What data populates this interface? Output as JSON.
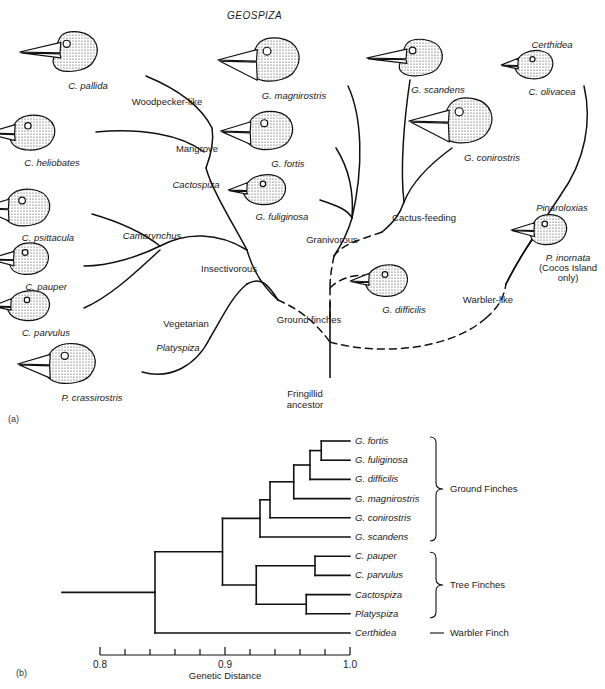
{
  "figure": {
    "panel_a_label": "(a)",
    "panel_b_label": "(b)",
    "genus_heading": "GEOSPIZA"
  },
  "panel_a": {
    "birds": [
      {
        "name": "C. pallida",
        "x": 60,
        "y": 28,
        "w": 84,
        "h": 48,
        "beak": "long",
        "label_x": 88,
        "label_y": 80
      },
      {
        "name": "C. heliobates",
        "x": 22,
        "y": 112,
        "w": 74,
        "h": 42,
        "beak": "medium",
        "label_x": 52,
        "label_y": 157
      },
      {
        "name": "C. psittacula",
        "x": 16,
        "y": 186,
        "w": 76,
        "h": 44,
        "beak": "thick",
        "label_x": 48,
        "label_y": 232
      },
      {
        "name": "C. pauper",
        "x": 20,
        "y": 240,
        "w": 64,
        "h": 38,
        "beak": "medium",
        "label_x": 46,
        "label_y": 281
      },
      {
        "name": "C. parvulus",
        "x": 22,
        "y": 288,
        "w": 62,
        "h": 36,
        "beak": "small",
        "label_x": 46,
        "label_y": 327
      },
      {
        "name": "P. crassirostris",
        "x": 58,
        "y": 340,
        "w": 84,
        "h": 48,
        "beak": "thick",
        "label_x": 92,
        "label_y": 392
      },
      {
        "name": "G. magnirostris",
        "x": 260,
        "y": 34,
        "w": 88,
        "h": 52,
        "beak": "huge",
        "label_x": 294,
        "label_y": 90
      },
      {
        "name": "G. fortis",
        "x": 258,
        "y": 108,
        "w": 78,
        "h": 46,
        "beak": "thick",
        "label_x": 288,
        "label_y": 158
      },
      {
        "name": "G. fuliginosa",
        "x": 258,
        "y": 172,
        "w": 62,
        "h": 36,
        "beak": "small",
        "label_x": 282,
        "label_y": 211
      },
      {
        "name": "G. scandens",
        "x": 406,
        "y": 36,
        "w": 82,
        "h": 44,
        "beak": "long",
        "label_x": 438,
        "label_y": 84
      },
      {
        "name": "G. conirostris",
        "x": 452,
        "y": 94,
        "w": 90,
        "h": 54,
        "beak": "huge",
        "label_x": 492,
        "label_y": 152
      },
      {
        "name": "C. olivacea",
        "x": 528,
        "y": 48,
        "w": 56,
        "h": 34,
        "beak": "small",
        "label_x": 552,
        "label_y": 86
      },
      {
        "name": "P. inornata",
        "x": 540,
        "y": 212,
        "w": 60,
        "h": 36,
        "beak": "medium",
        "label_x": 568,
        "label_y": 252
      },
      {
        "name": "G. difficilis",
        "x": 380,
        "y": 262,
        "w": 62,
        "h": 38,
        "beak": "small",
        "label_x": 404,
        "label_y": 304
      }
    ],
    "bird_extra_lines": [
      {
        "text": "(Cocos Island",
        "x": 568,
        "y": 262
      },
      {
        "text": "only)",
        "x": 568,
        "y": 272
      }
    ],
    "genus_labels": [
      {
        "text": "Cactospiza",
        "x": 196,
        "y": 179
      },
      {
        "text": "Camarynchus",
        "x": 152,
        "y": 230
      },
      {
        "text": "Platyspiza",
        "x": 178,
        "y": 342
      },
      {
        "text": "Certhidea",
        "x": 552,
        "y": 39
      },
      {
        "text": "Pinaroloxias",
        "x": 562,
        "y": 202
      }
    ],
    "node_labels": [
      {
        "text": "Woodpecker-like",
        "x": 167,
        "y": 96
      },
      {
        "text": "Mangrove",
        "x": 197,
        "y": 143
      },
      {
        "text": "Insectivorous",
        "x": 229,
        "y": 263
      },
      {
        "text": "Vegetarian",
        "x": 186,
        "y": 318
      },
      {
        "text": "Granivorous",
        "x": 332,
        "y": 234
      },
      {
        "text": "Cactus-feeding",
        "x": 424,
        "y": 212
      },
      {
        "text": "Ground finches",
        "x": 309,
        "y": 314
      },
      {
        "text": "Warbler-like",
        "x": 488,
        "y": 294
      }
    ],
    "root_label_lines": [
      "Fringillid",
      "ancestor"
    ],
    "root_label_x": 305,
    "root_label_y": 388
  },
  "chart_data": {
    "type": "tree",
    "title": "",
    "xlabel": "Genetic Distance",
    "xlim": [
      0.8,
      1.0
    ],
    "xticks_major": [
      0.8,
      0.9,
      1.0
    ],
    "xtick_labels": [
      "0.8",
      "0.9",
      "1.0"
    ],
    "xticks_minor": [
      0.82,
      0.84,
      0.86,
      0.88,
      0.92,
      0.94,
      0.96,
      0.98
    ],
    "grid": false,
    "leaves": [
      {
        "name": "G. fortis",
        "group": "Ground Finches"
      },
      {
        "name": "G. fuliginosa",
        "group": "Ground Finches"
      },
      {
        "name": "G. difficilis",
        "group": "Ground Finches"
      },
      {
        "name": "G. magnirostris",
        "group": "Ground Finches"
      },
      {
        "name": "G. conirostris",
        "group": "Ground Finches"
      },
      {
        "name": "G. scandens",
        "group": "Ground Finches"
      },
      {
        "name": "C. pauper",
        "group": "Tree Finches"
      },
      {
        "name": "C. parvulus",
        "group": "Tree Finches"
      },
      {
        "name": "Cactospiza",
        "group": "Tree Finches"
      },
      {
        "name": "Platyspiza",
        "group": "Tree Finches"
      },
      {
        "name": "Certhidea",
        "group": "Warbler Finch"
      }
    ],
    "nodes": [
      {
        "id": "n_fortis_fulig",
        "distance": 0.977,
        "children": [
          "G. fortis",
          "G. fuliginosa"
        ]
      },
      {
        "id": "n_diff",
        "distance": 0.968,
        "children": [
          "n_fortis_fulig",
          "G. difficilis"
        ]
      },
      {
        "id": "n_magni",
        "distance": 0.955,
        "children": [
          "n_diff",
          "G. magnirostris"
        ]
      },
      {
        "id": "n_coni",
        "distance": 0.936,
        "children": [
          "n_magni",
          "G. conirostris"
        ]
      },
      {
        "id": "n_scandens",
        "distance": 0.928,
        "children": [
          "n_coni",
          "G. scandens"
        ]
      },
      {
        "id": "n_pauper_parv",
        "distance": 0.972,
        "children": [
          "C. pauper",
          "C. parvulus"
        ]
      },
      {
        "id": "n_cacto_platy",
        "distance": 0.965,
        "children": [
          "Cactospiza",
          "Platyspiza"
        ]
      },
      {
        "id": "n_tree",
        "distance": 0.925,
        "children": [
          "n_pauper_parv",
          "n_cacto_platy"
        ]
      },
      {
        "id": "n_ground_tree",
        "distance": 0.898,
        "children": [
          "n_scandens",
          "n_tree"
        ]
      },
      {
        "id": "n_root",
        "distance": 0.844,
        "children": [
          "n_ground_tree",
          "Certhidea"
        ]
      }
    ],
    "brackets": [
      {
        "label": "Ground Finches",
        "first_leaf": "G. fortis",
        "last_leaf": "G. scandens"
      },
      {
        "label": "Tree Finches",
        "first_leaf": "C. pauper",
        "last_leaf": "Platyspiza"
      },
      {
        "label": "Warbler Finch",
        "first_leaf": "Certhidea",
        "last_leaf": "Certhidea"
      }
    ]
  }
}
